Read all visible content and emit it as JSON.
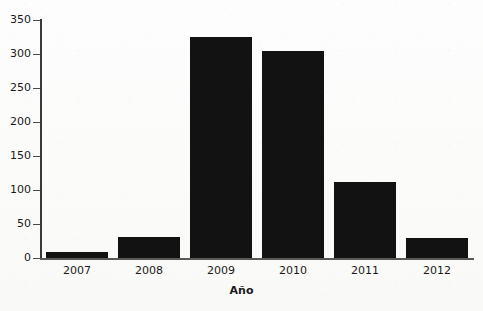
{
  "chart_data": {
    "type": "bar",
    "title": "",
    "subtitle": "",
    "xlabel": "Año",
    "ylabel": "",
    "categories": [
      "2007",
      "2008",
      "2009",
      "2010",
      "2011",
      "2012"
    ],
    "values": [
      9,
      31,
      325,
      304,
      112,
      29
    ],
    "ylim": [
      0,
      350
    ],
    "yticks": [
      0,
      50,
      100,
      150,
      200,
      250,
      300,
      350
    ],
    "ytick_labels": [
      "0",
      "50",
      "100",
      "150",
      "200",
      "250",
      "300",
      "350"
    ],
    "grid": false,
    "legend": null,
    "legend_position": "none",
    "bar_color": "#121212",
    "axis_color": "#3a3a3a",
    "background_color": "#fcfcfc",
    "annotations": []
  }
}
